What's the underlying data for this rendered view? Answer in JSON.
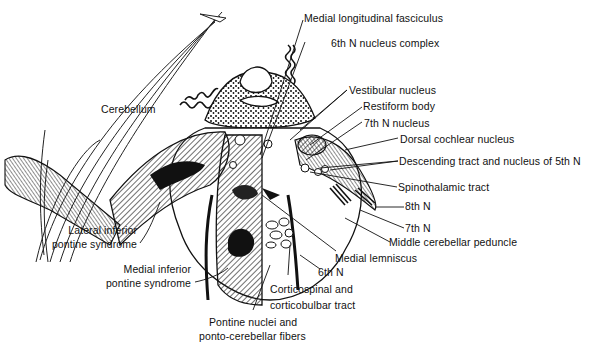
{
  "figure": {
    "colors": {
      "ink": "#111111",
      "background": "#ffffff",
      "hatch": "#222222"
    }
  },
  "labels": {
    "cerebellum": "Cerebellum",
    "mlf": "Medial longitudinal fasciculus",
    "sixth_complex": "6th N nucleus complex",
    "vestibular": "Vestibular nucleus",
    "restiform": "Restiform body",
    "seventh_nucleus": "7th N nucleus",
    "dorsal_cochlear": "Dorsal cochlear nucleus",
    "descending_5th": "Descending tract and nucleus of 5th N",
    "spinothalamic": "Spinothalamic tract",
    "eighth_n": "8th N",
    "seventh_n": "7th N",
    "mcp": "Middle cerebellar peduncle",
    "medial_lemniscus": "Medial lemniscus",
    "sixth_n": "6th N",
    "corticospinal_1": "Corticospinal and",
    "corticospinal_2": "corticobulbar tract",
    "pontine_1": "Pontine nuclei and",
    "pontine_2": "ponto-cerebellar fibers",
    "lateral_1": "Lateral inferior",
    "lateral_2": "pontine syndrome",
    "medial_1": "Medial inferior",
    "medial_2": "pontine syndrome"
  }
}
